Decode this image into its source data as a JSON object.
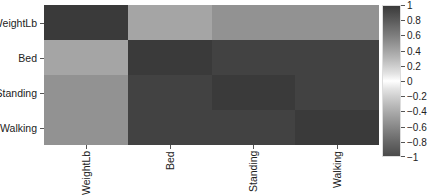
{
  "chart_data": {
    "type": "heatmap",
    "title": "",
    "xlabel": "",
    "ylabel": "",
    "rows": [
      "WeightLb",
      "Bed",
      "Standing",
      "Walking"
    ],
    "columns": [
      "WeightLb",
      "Bed",
      "Standing",
      "Walking"
    ],
    "values": [
      [
        1.0,
        0.4,
        0.5,
        0.5
      ],
      [
        0.4,
        1.0,
        0.95,
        0.95
      ],
      [
        0.5,
        0.95,
        1.0,
        0.95
      ],
      [
        0.5,
        0.95,
        0.95,
        1.0
      ]
    ],
    "colorbar": {
      "range": [
        -1,
        1
      ],
      "ticks": [
        "1",
        "0.8",
        "0.6",
        "0.4",
        "0.2",
        "0",
        "-0.2",
        "-0.4",
        "-0.6",
        "-0.8",
        "-1"
      ],
      "colors": {
        "high": "#3a3a3a",
        "mid": "#ffffff",
        "low": "#4a4a4a"
      }
    },
    "grid": false,
    "legend_position": "right"
  }
}
